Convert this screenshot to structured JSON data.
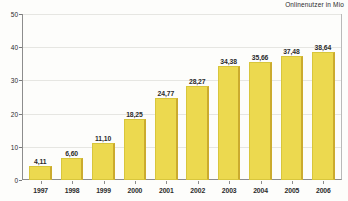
{
  "chart_data": {
    "type": "bar",
    "title": "",
    "subtitle": "Onlinenutzer in Mio",
    "xlabel": "",
    "ylabel": "",
    "categories": [
      "1997",
      "1998",
      "1999",
      "2000",
      "2001",
      "2002",
      "2003",
      "2004",
      "2005",
      "2006"
    ],
    "values": [
      4.11,
      6.6,
      11.1,
      18.25,
      24.77,
      28.27,
      34.38,
      35.66,
      37.48,
      38.64
    ],
    "value_labels": [
      "4,11",
      "6,60",
      "11,10",
      "18,25",
      "24,77",
      "28,27",
      "34,38",
      "35,66",
      "37,48",
      "38,64"
    ],
    "ylim": [
      0,
      50
    ],
    "yticks": [
      0,
      10,
      20,
      30,
      40,
      50
    ],
    "ytick_labels": [
      "0",
      "10",
      "20",
      "30",
      "40",
      "50"
    ],
    "grid": true,
    "legend": false,
    "series": [
      {
        "name": "Onlinenutzer in Mio",
        "color": "#ecd94f",
        "values": [
          4.11,
          6.6,
          11.1,
          18.25,
          24.77,
          28.27,
          34.38,
          35.66,
          37.48,
          38.64
        ]
      }
    ]
  },
  "colors": {
    "bar_fill": "#ecd94f",
    "bar_edge": "#cbab2e",
    "axis": "#8d8d8d",
    "grid": "#e6e6e2",
    "text": "#2b2b2b",
    "background": "#fdfdfb"
  }
}
